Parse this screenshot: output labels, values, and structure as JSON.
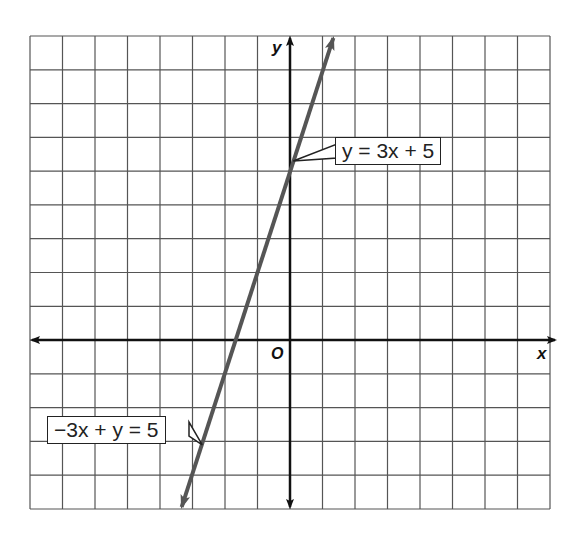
{
  "chart_data": {
    "type": "line",
    "title": "",
    "xlabel": "x",
    "ylabel": "y",
    "origin_label": "O",
    "grid": true,
    "xlim": [
      -8,
      8
    ],
    "ylim": [
      -5,
      9
    ],
    "grid_step": 1,
    "series": [
      {
        "name": "y = 3x + 5",
        "alt_name": "−3x + y = 5",
        "slope": 3,
        "intercept": 5,
        "x": [
          -3.333,
          1.333
        ],
        "y": [
          -5,
          9
        ],
        "color": "#555555"
      }
    ],
    "annotations": [
      {
        "text": "y = 3x + 5",
        "points_to": [
          0.1,
          5.3
        ]
      },
      {
        "text": "−3x + y = 5",
        "points_to": [
          -2.7,
          -3.1
        ]
      }
    ]
  },
  "labels": {
    "x_axis": "x",
    "y_axis": "y",
    "origin": "O",
    "callout_top": "y = 3x + 5",
    "callout_bottom": "−3x + y = 5"
  },
  "colors": {
    "grid": "#555555",
    "axis": "#111111",
    "line": "#555555",
    "background": "#ffffff"
  }
}
